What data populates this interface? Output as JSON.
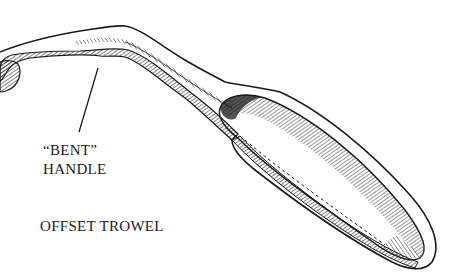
{
  "figure": {
    "callout": {
      "line1": "“BENT”",
      "line2": "HANDLE"
    },
    "caption": "OFFSET TROWEL"
  },
  "colors": {
    "ink": "#1a1a1a",
    "background": "#ffffff"
  }
}
